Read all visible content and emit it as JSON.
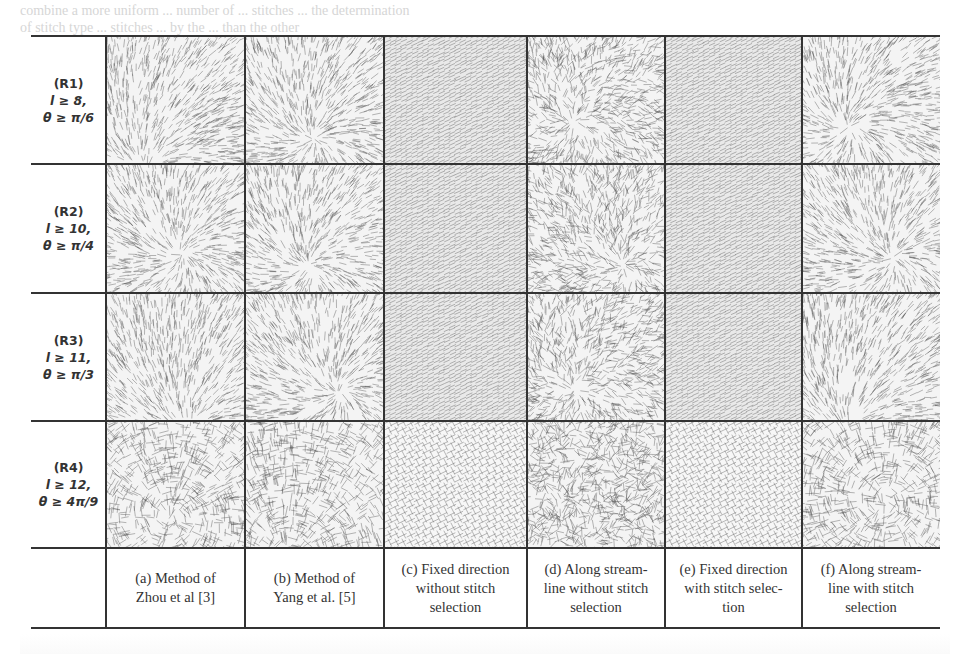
{
  "page": {
    "background_text_line1": "combine a more uniform ... number of ... stitches ... the determination",
    "background_text_line2": "of stitch type ... stitches ... by the ... than the other"
  },
  "table": {
    "rows": [
      {
        "id": "R1",
        "lines": [
          "(R1)",
          "l ≥ 8,",
          "θ ≥ π/6"
        ]
      },
      {
        "id": "R2",
        "lines": [
          "(R2)",
          "l ≥ 10,",
          "θ ≥ π/4"
        ]
      },
      {
        "id": "R3",
        "lines": [
          "(R3)",
          "l ≥ 11,",
          "θ ≥ π/3"
        ]
      },
      {
        "id": "R4",
        "lines": [
          "(R4)",
          "l ≥ 12,",
          "θ ≥ 4π/9"
        ]
      }
    ],
    "columns": [
      {
        "id": "a",
        "lines": [
          "(a) Method of",
          "Zhou et al [3]"
        ],
        "texture": "flow"
      },
      {
        "id": "b",
        "lines": [
          "(b) Method of",
          "Yang et al. [5]"
        ],
        "texture": "flow"
      },
      {
        "id": "c",
        "lines": [
          "(c) Fixed direction",
          "without stitch",
          "selection"
        ],
        "texture": "fixed"
      },
      {
        "id": "d",
        "lines": [
          "(d) Along stream-",
          "line without stitch",
          "selection"
        ],
        "texture": "noisy"
      },
      {
        "id": "e",
        "lines": [
          "(e) Fixed direction",
          "with stitch selec-",
          "tion"
        ],
        "texture": "fixed"
      },
      {
        "id": "f",
        "lines": [
          "(f) Along stream-",
          "line with stitch",
          "selection"
        ],
        "texture": "flow"
      }
    ]
  }
}
